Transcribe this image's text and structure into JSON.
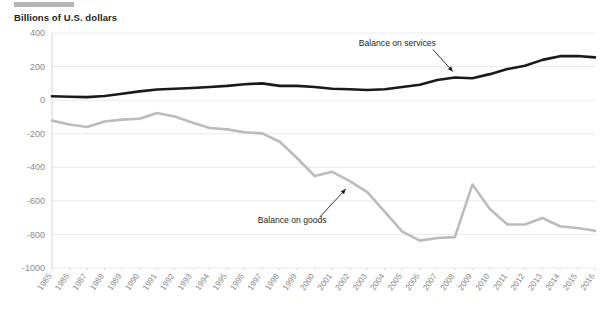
{
  "figure": {
    "axis_title": "Billions of U.S. dollars",
    "accent_rule_color": "#b5b5b5"
  },
  "chart_data": {
    "type": "line",
    "title": "",
    "subtitle": "",
    "xlabel": "",
    "ylabel": "Billions of U.S. dollars",
    "ylim": [
      -1000,
      400
    ],
    "yticks": [
      400,
      200,
      0,
      -200,
      -400,
      -600,
      -800,
      -1000
    ],
    "ytick_labels": [
      "400",
      "200",
      "0",
      "-200",
      "-400",
      "-600",
      "-800",
      "-1000"
    ],
    "grid": true,
    "grid_axis": "y",
    "legend": "annotations",
    "legend_position": "inline-annotations",
    "x": [
      1985,
      1986,
      1987,
      1988,
      1989,
      1990,
      1991,
      1992,
      1993,
      1994,
      1995,
      1996,
      1997,
      1998,
      1999,
      2000,
      2001,
      2002,
      2003,
      2004,
      2005,
      2006,
      2007,
      2008,
      2009,
      2010,
      2011,
      2012,
      2013,
      2014,
      2015,
      2016
    ],
    "xtick_labels": [
      "1985",
      "1986",
      "1987",
      "1988",
      "1989",
      "1990",
      "1991",
      "1992",
      "1993",
      "1994",
      "1995",
      "1996",
      "1997",
      "1998",
      "1999",
      "2000",
      "2001",
      "2002",
      "2003",
      "2004",
      "2005",
      "2006",
      "2007",
      "2008",
      "2009",
      "2010",
      "2011",
      "2012",
      "2013",
      "2014",
      "2015",
      "2016"
    ],
    "series": [
      {
        "name": "Balance on services",
        "color": "#1a1a1a",
        "width": 2.6,
        "values": [
          23,
          20,
          18,
          25,
          38,
          52,
          63,
          68,
          72,
          78,
          85,
          95,
          100,
          85,
          85,
          78,
          68,
          65,
          60,
          65,
          78,
          92,
          120,
          135,
          130,
          155,
          185,
          205,
          240,
          262,
          263,
          255
        ]
      },
      {
        "name": "Balance on goods",
        "color": "#bcbcbc",
        "width": 2.6,
        "values": [
          -122,
          -145,
          -160,
          -127,
          -116,
          -111,
          -77,
          -97,
          -133,
          -166,
          -174,
          -191,
          -198,
          -248,
          -346,
          -452,
          -427,
          -482,
          -548,
          -665,
          -783,
          -837,
          -821,
          -816,
          -503,
          -648,
          -741,
          -741,
          -702,
          -751,
          -762,
          -778
        ]
      }
    ],
    "annotations": [
      {
        "text": "Balance on services",
        "series": "Balance on services",
        "points_to_year": 2008,
        "points_to_value": 135
      },
      {
        "text": "Balance on goods",
        "series": "Balance on goods",
        "points_to_year": 2002,
        "points_to_value": -482
      }
    ]
  }
}
